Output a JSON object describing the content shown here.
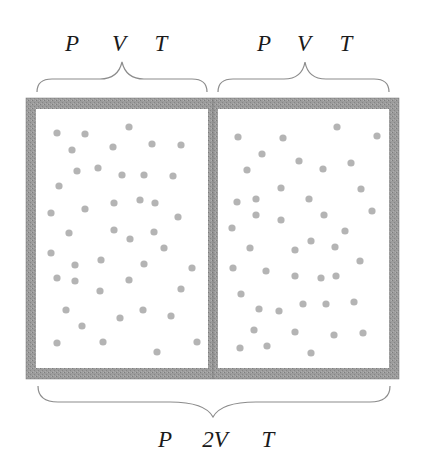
{
  "colors": {
    "wall": "#9a9a9a",
    "wall_dark": "#7a7a7a",
    "molecule": "#b4b4b4",
    "brace": "#8c8c8c",
    "text": "#1a1a1a",
    "background": "#ffffff"
  },
  "top_left_labels": {
    "pressure": "P",
    "volume": "V",
    "temperature": "T"
  },
  "top_right_labels": {
    "pressure": "P",
    "volume": "V",
    "temperature": "T"
  },
  "bottom_labels": {
    "pressure": "P",
    "volume": "2V",
    "temperature": "T"
  },
  "container": {
    "outer": {
      "x": 26,
      "y": 98,
      "width": 373,
      "height": 281
    },
    "wall_thickness": 10,
    "divider": {
      "x": 208,
      "width": 10
    }
  },
  "left_chamber": {
    "molecules": [
      [
        57,
        133
      ],
      [
        85,
        134
      ],
      [
        129,
        127
      ],
      [
        72,
        150
      ],
      [
        113,
        147
      ],
      [
        152,
        144
      ],
      [
        181,
        145
      ],
      [
        77,
        171
      ],
      [
        98,
        168
      ],
      [
        122,
        175
      ],
      [
        144,
        175
      ],
      [
        173,
        176
      ],
      [
        59,
        186
      ],
      [
        51,
        213
      ],
      [
        85,
        209
      ],
      [
        114,
        203
      ],
      [
        140,
        200
      ],
      [
        155,
        203
      ],
      [
        178,
        217
      ],
      [
        69,
        233
      ],
      [
        114,
        230
      ],
      [
        130,
        239
      ],
      [
        154,
        232
      ],
      [
        51,
        253
      ],
      [
        164,
        248
      ],
      [
        75,
        265
      ],
      [
        101,
        260
      ],
      [
        144,
        264
      ],
      [
        192,
        268
      ],
      [
        57,
        278
      ],
      [
        75,
        281
      ],
      [
        129,
        280
      ],
      [
        100,
        291
      ],
      [
        181,
        289
      ],
      [
        66,
        310
      ],
      [
        143,
        310
      ],
      [
        120,
        318
      ],
      [
        171,
        316
      ],
      [
        82,
        326
      ],
      [
        57,
        343
      ],
      [
        103,
        342
      ],
      [
        197,
        342
      ],
      [
        157,
        352
      ]
    ]
  },
  "right_chamber": {
    "molecules": [
      [
        238,
        137
      ],
      [
        283,
        138
      ],
      [
        337,
        127
      ],
      [
        377,
        136
      ],
      [
        262,
        154
      ],
      [
        299,
        161
      ],
      [
        351,
        163
      ],
      [
        247,
        170
      ],
      [
        323,
        169
      ],
      [
        281,
        188
      ],
      [
        361,
        189
      ],
      [
        237,
        202
      ],
      [
        256,
        199
      ],
      [
        309,
        199
      ],
      [
        256,
        215
      ],
      [
        281,
        220
      ],
      [
        324,
        215
      ],
      [
        372,
        211
      ],
      [
        232,
        228
      ],
      [
        345,
        231
      ],
      [
        311,
        241
      ],
      [
        250,
        248
      ],
      [
        295,
        250
      ],
      [
        335,
        247
      ],
      [
        360,
        261
      ],
      [
        233,
        268
      ],
      [
        266,
        271
      ],
      [
        295,
        276
      ],
      [
        321,
        278
      ],
      [
        336,
        276
      ],
      [
        241,
        294
      ],
      [
        259,
        309
      ],
      [
        279,
        311
      ],
      [
        303,
        304
      ],
      [
        326,
        304
      ],
      [
        354,
        302
      ],
      [
        254,
        330
      ],
      [
        295,
        332
      ],
      [
        334,
        335
      ],
      [
        363,
        333
      ],
      [
        240,
        348
      ],
      [
        267,
        346
      ],
      [
        311,
        353
      ]
    ]
  }
}
